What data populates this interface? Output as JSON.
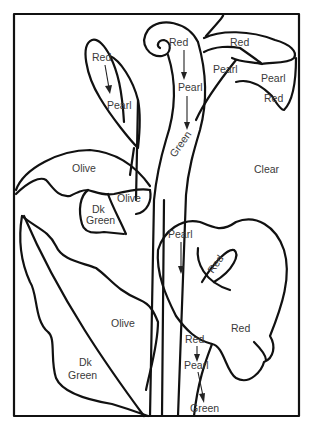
{
  "colors": {
    "line": "#111111",
    "label": "#3a3a3a",
    "background": "#ffffff"
  },
  "labels": {
    "bud_top": "Red",
    "bud_bottom": "Pearl",
    "stem_top": "Red",
    "stem_mid": "Pearl",
    "stem_bottom": "Green",
    "flower_top_red": "Red",
    "flower_top_pearl_left": "Pearl",
    "flower_top_pearl_right": "Pearl",
    "flower_top_red_lower": "Red",
    "flower_top_clear": "Clear",
    "leaf_upper_olive": "Olive",
    "leaf_small_olive": "Olive",
    "leaf_small_dk": "Dk",
    "leaf_small_green": "Green",
    "flower_bottom_pearl": "Pearl",
    "flower_bottom_spadix": "Red",
    "flower_bottom_red": "Red",
    "leaf_lower_olive": "Olive",
    "leaf_lower_dk": "Dk",
    "leaf_lower_green": "Green",
    "stem2_top": "Red",
    "stem2_mid": "Pearl",
    "stem2_bottom": "Green"
  }
}
